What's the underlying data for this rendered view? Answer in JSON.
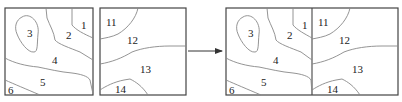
{
  "diagram": {
    "left_tile": {
      "regions": [
        "1",
        "2",
        "3",
        "4",
        "5",
        "6"
      ]
    },
    "right_tile": {
      "regions": [
        "11",
        "12",
        "13",
        "14"
      ]
    },
    "arrow": "right-arrow",
    "merged_tile": {
      "regions": [
        "1",
        "2",
        "3",
        "4",
        "5",
        "6",
        "11",
        "12",
        "13",
        "14"
      ]
    }
  },
  "labels": {
    "a1": "1",
    "a2": "2",
    "a3": "3",
    "a4": "4",
    "a5": "5",
    "a6": "6",
    "b11": "11",
    "b12": "12",
    "b13": "13",
    "b14": "14",
    "c1": "1",
    "c2": "2",
    "c3": "3",
    "c4": "4",
    "c5": "5",
    "c6": "6",
    "c11": "11",
    "c12": "12",
    "c13": "13",
    "c14": "14"
  }
}
